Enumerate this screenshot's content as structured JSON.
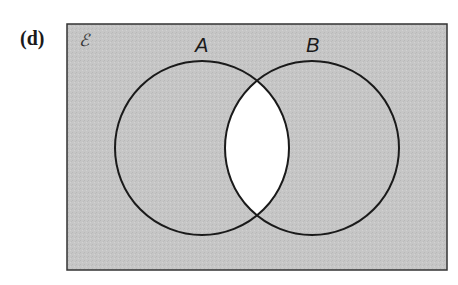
{
  "figure_label": "(d)",
  "universal_set_symbol": "ℰ",
  "sets": [
    {
      "name": "A",
      "label": "A"
    },
    {
      "name": "B",
      "label": "B"
    }
  ],
  "shading": {
    "shaded_region": "complement of A ∩ B",
    "shade_color": "#c4c4c4",
    "unshaded_color": "#ffffff"
  }
}
